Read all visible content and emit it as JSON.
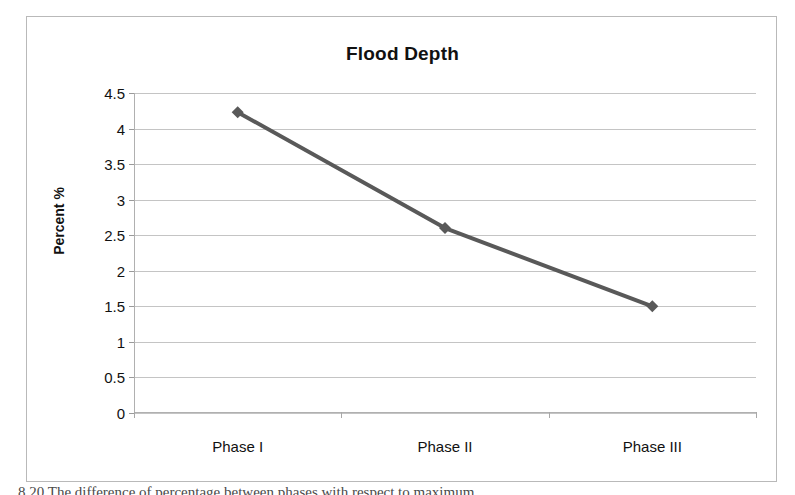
{
  "figure": {
    "caption_partial": "8.20  The difference of percentage between phases with respect to maximum"
  },
  "chart_data": {
    "type": "line",
    "title": "Flood Depth",
    "xlabel": "",
    "ylabel": "Percent %",
    "categories": [
      "Phase I",
      "Phase II",
      "Phase III"
    ],
    "series": [
      {
        "name": "Flood Depth",
        "values": [
          4.23,
          2.6,
          1.5
        ],
        "color": "#595959",
        "marker": "diamond"
      }
    ],
    "ylim": [
      0,
      4.5
    ],
    "y_ticks": [
      "0",
      "0.5",
      "1",
      "1.5",
      "2",
      "2.5",
      "3",
      "3.5",
      "4",
      "4.5"
    ],
    "y_tick_values": [
      0,
      0.5,
      1,
      1.5,
      2,
      2.5,
      3,
      3.5,
      4,
      4.5
    ],
    "grid": true,
    "legend": false,
    "legend_position": "none"
  },
  "colors": {
    "series_line": "#595959",
    "gridline": "#c4c4c4",
    "axis": "#b0b0b0",
    "frame": "#b9b9b9",
    "text": "#111111",
    "background": "#ffffff"
  }
}
